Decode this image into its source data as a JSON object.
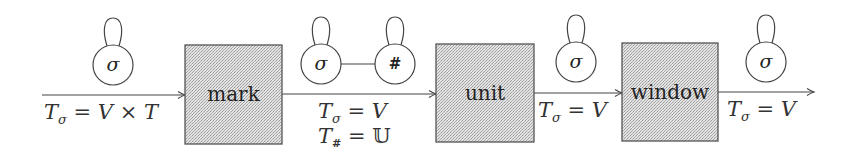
{
  "diagram": {
    "type": "pipeline",
    "colors": {
      "box_fill": "#d4d4d4",
      "stroke": "#444444",
      "text": "#222222"
    },
    "stages": [
      {
        "id": "mark",
        "label": "mark"
      },
      {
        "id": "unit",
        "label": "unit"
      },
      {
        "id": "window",
        "label": "window"
      }
    ],
    "edges": [
      {
        "from": "input",
        "to": "mark",
        "nodes": [
          {
            "symbol": "σ"
          }
        ],
        "labels": [
          {
            "var": "T",
            "sub": "σ",
            "rhs": "V × T"
          }
        ]
      },
      {
        "from": "mark",
        "to": "unit",
        "nodes": [
          {
            "symbol": "σ"
          },
          {
            "symbol": "#"
          }
        ],
        "node_link": true,
        "labels": [
          {
            "var": "T",
            "sub": "σ",
            "rhs": "V"
          },
          {
            "var": "T",
            "sub": "#",
            "rhs": "𝕌"
          }
        ]
      },
      {
        "from": "unit",
        "to": "window",
        "nodes": [
          {
            "symbol": "σ"
          }
        ],
        "labels": [
          {
            "var": "T",
            "sub": "σ",
            "rhs": "V"
          }
        ]
      },
      {
        "from": "window",
        "to": "output",
        "nodes": [
          {
            "symbol": "σ"
          }
        ],
        "labels": [
          {
            "var": "T",
            "sub": "σ",
            "rhs": "V"
          }
        ]
      }
    ]
  }
}
